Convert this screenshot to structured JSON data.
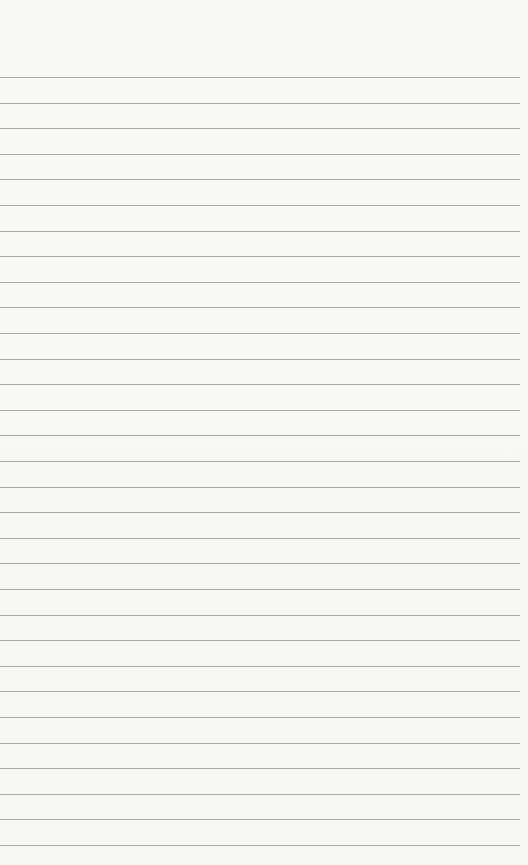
{
  "paper": {
    "type": "lined-notepad",
    "background_color": "#f7f7f5",
    "line_color": "#a9a9a7",
    "line_count": 31,
    "first_line_y": 77,
    "line_spacing": 25.6,
    "text": ""
  }
}
